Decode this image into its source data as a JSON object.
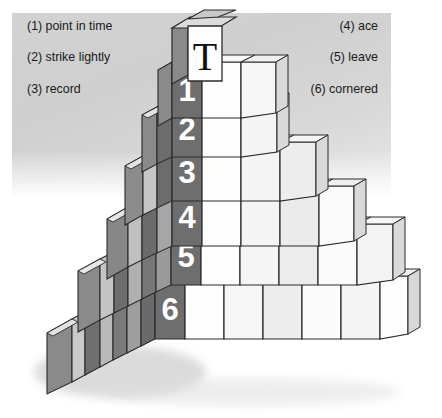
{
  "clues": {
    "left": [
      "(1) point in time",
      "(2) strike lightly",
      "(3) record"
    ],
    "right": [
      "(4) ace",
      "(5) leave",
      "(6) cornered"
    ]
  },
  "pyramid": {
    "apex_label": "T",
    "numbered_labels": [
      "1",
      "2",
      "3",
      "4",
      "5",
      "6"
    ],
    "row_counts": [
      1,
      3,
      4,
      5,
      6,
      7,
      8
    ],
    "colors": {
      "face_light": "#fdfdfd",
      "face_shade": "#efefef",
      "face_dark": "#6e6e6e",
      "side_dark": "#585858",
      "side_mid": "#8d8d8d",
      "top_face": "#f2f2f2",
      "outline": "#2b2b2b",
      "numeral": "#ffffff",
      "panel": "#d2d2d2",
      "text": "#1a1a1a"
    }
  }
}
